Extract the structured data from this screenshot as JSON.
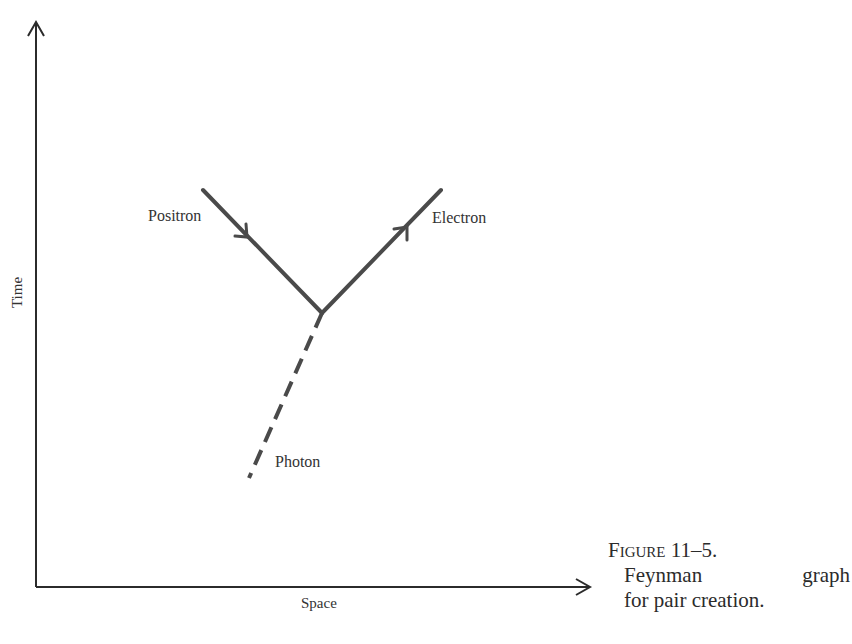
{
  "diagram": {
    "axes": {
      "x_label": "Space",
      "y_label": "Time"
    },
    "particles": [
      {
        "name": "Positron",
        "type": "fermion line",
        "direction_arrow": "toward vertex"
      },
      {
        "name": "Electron",
        "type": "fermion line",
        "direction_arrow": "away from vertex"
      },
      {
        "name": "Photon",
        "type": "dashed line",
        "direction_arrow": "none"
      }
    ],
    "labels": {
      "positron": "Positron",
      "electron": "Electron",
      "photon": "Photon"
    },
    "colors": {
      "lines": "#4a4a4a",
      "axes": "#2b2b2b",
      "text": "#333333"
    }
  },
  "caption": {
    "figure_number": "Figure 11–5.",
    "line1_word1": "Feynman",
    "line1_word2": "graph",
    "line2": "for pair creation."
  }
}
